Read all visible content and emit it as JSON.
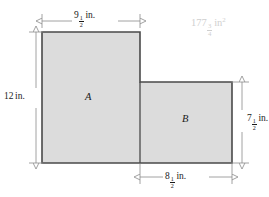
{
  "figure": {
    "fill_color": "#dcdcdc",
    "outline_color": "#4a4a4a",
    "dimension_line_color": "#8a8a8a",
    "answer_color": "#cfcfcf",
    "regions": [
      {
        "id": "A",
        "label": "A"
      },
      {
        "id": "B",
        "label": "B"
      }
    ],
    "dimensions": {
      "top_width": {
        "whole": "9",
        "num": "1",
        "den": "2",
        "unit": "in."
      },
      "left_height": {
        "whole": "12",
        "num": "",
        "den": "",
        "unit": "in."
      },
      "right_height": {
        "whole": "7",
        "num": "1",
        "den": "2",
        "unit": "in."
      },
      "bottom_width": {
        "whole": "8",
        "num": "1",
        "den": "2",
        "unit": "in."
      }
    },
    "answer": {
      "whole": "177",
      "num": "3",
      "den": "4",
      "unit": "in",
      "exponent": "2"
    }
  }
}
